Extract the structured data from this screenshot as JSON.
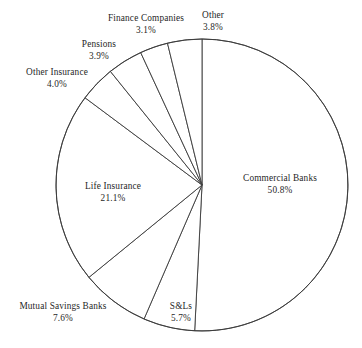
{
  "chart_data": {
    "type": "pie",
    "title": "",
    "subtitle": "",
    "xlabel": "",
    "ylabel": "",
    "legend_position": "none",
    "grid": false,
    "start_angle_deg": 90,
    "direction": "clockwise",
    "units": "percent",
    "categories": [
      "Commercial Banks",
      "S&Ls",
      "Mutual Savings Banks",
      "Life Insurance",
      "Other Insurance",
      "Pensions",
      "Finance Companies",
      "Other"
    ],
    "values": [
      50.8,
      5.7,
      7.6,
      21.1,
      4.0,
      3.9,
      3.1,
      3.8
    ],
    "slices": [
      {
        "name": "Commercial Banks",
        "value": 50.8,
        "label": "Commercial Banks",
        "percent_label": "50.8%",
        "label_x": 280,
        "label_y": 185,
        "label_inside": true
      },
      {
        "name": "S&Ls",
        "value": 5.7,
        "label": "S&Ls",
        "percent_label": "5.7%",
        "label_x": 181,
        "label_y": 313,
        "label_inside": true
      },
      {
        "name": "Mutual Savings Banks",
        "value": 7.6,
        "label": "Mutual Savings Banks",
        "percent_label": "7.6%",
        "label_x": 63,
        "label_y": 313,
        "label_inside": false
      },
      {
        "name": "Life Insurance",
        "value": 21.1,
        "label": "Life Insurance",
        "percent_label": "21.1%",
        "label_x": 113,
        "label_y": 193,
        "label_inside": true
      },
      {
        "name": "Other Insurance",
        "value": 4.0,
        "label": "Other Insurance",
        "percent_label": "4.0%",
        "label_x": 57,
        "label_y": 79,
        "label_inside": false
      },
      {
        "name": "Pensions",
        "value": 3.9,
        "label": "Pensions",
        "percent_label": "3.9%",
        "label_x": 99,
        "label_y": 51,
        "label_inside": false
      },
      {
        "name": "Finance Companies",
        "value": 3.1,
        "label": "Finance Companies",
        "percent_label": "3.1%",
        "label_x": 146,
        "label_y": 25,
        "label_inside": false
      },
      {
        "name": "Other",
        "value": 3.8,
        "label": "Other",
        "percent_label": "3.8%",
        "label_x": 213,
        "label_y": 22,
        "label_inside": false
      }
    ],
    "geometry": {
      "center_x": 202,
      "center_y": 185,
      "radius": 146
    },
    "colors": {
      "background": "#ffffff",
      "stroke": "#3a3a3a",
      "text": "#1f1f1f"
    }
  }
}
